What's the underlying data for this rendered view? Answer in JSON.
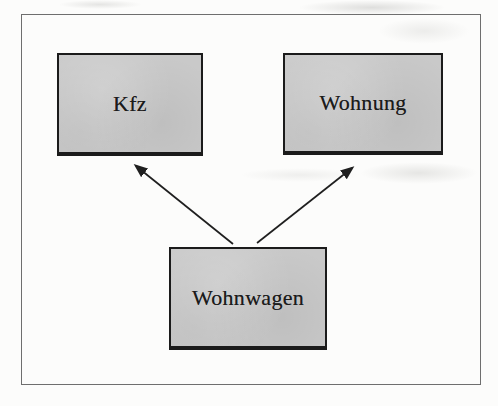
{
  "diagram": {
    "nodes": [
      {
        "id": "kfz",
        "label": "Kfz"
      },
      {
        "id": "wohnung",
        "label": "Wohnung"
      },
      {
        "id": "wohnwagen",
        "label": "Wohnwagen"
      }
    ],
    "edges": [
      {
        "from": "wohnwagen",
        "to": "kfz",
        "style": "solid-arrow"
      },
      {
        "from": "wohnwagen",
        "to": "wohnung",
        "style": "solid-arrow"
      }
    ],
    "colors": {
      "background": "#fcfcfb",
      "node_fill": "#c9c9c9",
      "node_border": "#1b1b1b",
      "frame_border": "#6e6e6e",
      "arrow": "#1f1f1f",
      "text": "#1b1b1b"
    }
  }
}
